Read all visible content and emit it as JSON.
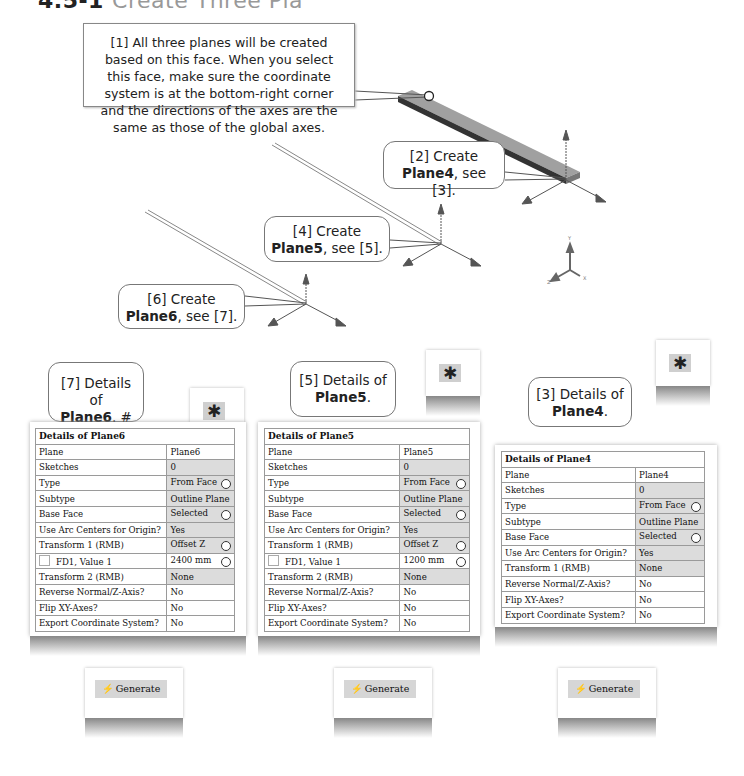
{
  "heading": {
    "number": "4.5-1",
    "title": "Create Three Pla"
  },
  "note": {
    "text": "[1] All three planes will be created based on this face. When you select this face, make sure the coordinate system is at the bottom-right corner and the directions of the axes are the same as those of the global axes."
  },
  "callouts": [
    {
      "id": "2",
      "line1": "[2] Create",
      "bold": "Plane4",
      "rest": ", see [3]."
    },
    {
      "id": "4",
      "line1": "[4] Create",
      "bold": "Plane5",
      "rest": ", see [5]."
    },
    {
      "id": "6",
      "line1": "[6] Create",
      "bold": "Plane6",
      "rest": ", see [7]."
    },
    {
      "id": "7",
      "line1": "[7] Details of",
      "bold": "Plane6",
      "rest": ". #"
    },
    {
      "id": "5",
      "line1": "[5] Details of",
      "bold": "Plane5",
      "rest": "."
    },
    {
      "id": "3",
      "line1": "[3] Details of",
      "bold": "Plane4",
      "rest": "."
    }
  ],
  "axis_triad": {
    "labels": [
      "Y",
      "Z",
      "X"
    ]
  },
  "panels": {
    "plane6": {
      "title": "Details of Plane6",
      "rows": [
        {
          "label": "Plane",
          "value": "Plane6"
        },
        {
          "label": "Sketches",
          "value": "0"
        },
        {
          "label": "Type",
          "value": "From Face"
        },
        {
          "label": "Subtype",
          "value": "Outline Plane"
        },
        {
          "label": "Base Face",
          "value": "Selected"
        },
        {
          "label": "Use Arc Centers for Origin?",
          "value": "Yes"
        },
        {
          "label": "Transform 1 (RMB)",
          "value": "Offset Z"
        },
        {
          "label": "FD1, Value 1",
          "value": "2400 mm"
        },
        {
          "label": "Transform 2 (RMB)",
          "value": "None"
        },
        {
          "label": "Reverse Normal/Z-Axis?",
          "value": "No"
        },
        {
          "label": "Flip XY-Axes?",
          "value": "No"
        },
        {
          "label": "Export Coordinate System?",
          "value": "No"
        }
      ]
    },
    "plane5": {
      "title": "Details of Plane5",
      "rows": [
        {
          "label": "Plane",
          "value": "Plane5"
        },
        {
          "label": "Sketches",
          "value": "0"
        },
        {
          "label": "Type",
          "value": "From Face"
        },
        {
          "label": "Subtype",
          "value": "Outline Plane"
        },
        {
          "label": "Base Face",
          "value": "Selected"
        },
        {
          "label": "Use Arc Centers for Origin?",
          "value": "Yes"
        },
        {
          "label": "Transform 1 (RMB)",
          "value": "Offset Z"
        },
        {
          "label": "FD1, Value 1",
          "value": "1200 mm"
        },
        {
          "label": "Transform 2 (RMB)",
          "value": "None"
        },
        {
          "label": "Reverse Normal/Z-Axis?",
          "value": "No"
        },
        {
          "label": "Flip XY-Axes?",
          "value": "No"
        },
        {
          "label": "Export Coordinate System?",
          "value": "No"
        }
      ]
    },
    "plane4": {
      "title": "Details of Plane4",
      "rows": [
        {
          "label": "Plane",
          "value": "Plane4"
        },
        {
          "label": "Sketches",
          "value": "0"
        },
        {
          "label": "Type",
          "value": "From Face"
        },
        {
          "label": "Subtype",
          "value": "Outline Plane"
        },
        {
          "label": "Base Face",
          "value": "Selected"
        },
        {
          "label": "Use Arc Centers for Origin?",
          "value": "Yes"
        },
        {
          "label": "Transform 1 (RMB)",
          "value": "None"
        },
        {
          "label": "Reverse Normal/Z-Axis?",
          "value": "No"
        },
        {
          "label": "Flip XY-Axes?",
          "value": "No"
        },
        {
          "label": "Export Coordinate System?",
          "value": "No"
        }
      ]
    }
  },
  "toolbar": {
    "new_plane_icon": "✱",
    "generate_label": "Generate",
    "generate_icon": "⚡"
  },
  "colors": {
    "beam_top": "#9a9a9a",
    "beam_side": "#3a3a3a",
    "grid_line": "#9a9a9a",
    "gray_cell": "#dcdcdc"
  }
}
